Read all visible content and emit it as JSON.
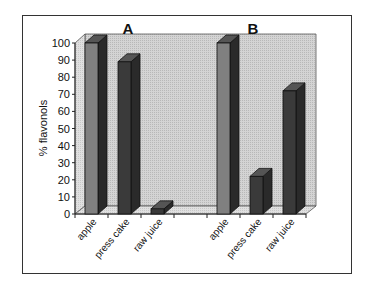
{
  "chart_data": {
    "type": "bar",
    "style": "3d-column",
    "panels": [
      {
        "title": "A",
        "categories": [
          "apple",
          "press cake",
          "raw juice"
        ],
        "values": [
          100,
          89,
          3
        ]
      },
      {
        "title": "B",
        "categories": [
          "apple",
          "press cake",
          "raw juice"
        ],
        "values": [
          100,
          22,
          72
        ]
      }
    ],
    "ylabel": "% flavonols",
    "xlabel": "",
    "ylim": [
      0,
      100
    ],
    "yticks": [
      "0",
      "10",
      "20",
      "30",
      "40",
      "50",
      "60",
      "70",
      "80",
      "90",
      "100"
    ],
    "grid": false,
    "legend": null,
    "colors": {
      "apple": "#808080",
      "press_cake": "#3a3a3a",
      "raw_juice": "#3a3a3a",
      "wall": "#c8c8c8",
      "floor": "#dcdcdc"
    }
  }
}
